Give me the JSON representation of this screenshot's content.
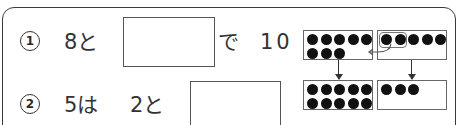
{
  "problems": [
    {
      "number": "1",
      "parts": [
        "8と",
        "で",
        "10"
      ],
      "answer": ""
    },
    {
      "number": "2",
      "parts": [
        "5は",
        "2と"
      ],
      "answer": ""
    }
  ],
  "diagram": {
    "top_left_dots": 8,
    "top_right_dots": 5,
    "grouped_dots": 2,
    "bottom_left_dots": 10,
    "bottom_right_dots": 3
  }
}
